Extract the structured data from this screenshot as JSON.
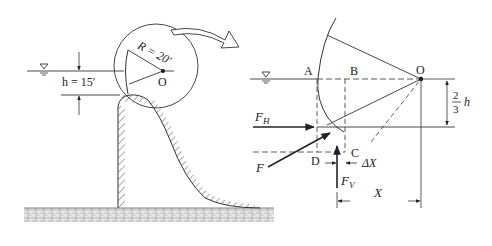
{
  "left_figure": {
    "depth_label": "h = 15′",
    "radius_label": "R = 20′",
    "center_label": "O",
    "water_surface_icon": "water-surface-triangle"
  },
  "right_figure": {
    "points": {
      "A": "A",
      "B": "B",
      "C": "C",
      "D": "D",
      "O": "O"
    },
    "forces": {
      "horizontal": "F",
      "horizontal_sub": "H",
      "vertical": "F",
      "vertical_sub": "V",
      "resultant": "F"
    },
    "dims": {
      "frac_num": "2",
      "frac_den": "3",
      "frac_var": "h",
      "delta_x": "ΔX",
      "x": "X"
    },
    "water_surface_icon": "water-surface-triangle"
  },
  "colors": {
    "line": "#333333",
    "hatch": "#555555",
    "background": "#ffffff"
  }
}
